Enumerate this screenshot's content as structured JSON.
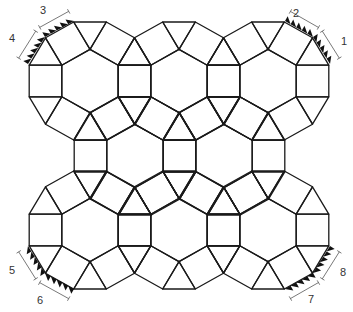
{
  "figure": {
    "edge_length": 32.6,
    "y_scale": 0.97,
    "colors": {
      "line": "#1a1a1a",
      "teeth": "#111111",
      "dimension": "#555555",
      "label": "#333333",
      "background": "#ffffff"
    },
    "hexagons": [
      {
        "cx": 90,
        "cy": 81
      },
      {
        "cx": 179,
        "cy": 81
      },
      {
        "cx": 268,
        "cy": 81
      },
      {
        "cx": 135,
        "cy": 156
      },
      {
        "cx": 224,
        "cy": 156
      },
      {
        "cx": 90,
        "cy": 230
      },
      {
        "cx": 179,
        "cy": 230
      },
      {
        "cx": 268,
        "cy": 230
      }
    ],
    "marked_edges": [
      {
        "label": "1",
        "x1": 330,
        "y1": 64,
        "x2": 313,
        "y2": 37,
        "label_x": 344,
        "label_y": 45
      },
      {
        "label": "2",
        "x1": 313,
        "y1": 37,
        "x2": 285,
        "y2": 21,
        "label_x": 296,
        "label_y": 17
      },
      {
        "label": "3",
        "x1": 74,
        "y1": 21,
        "x2": 45,
        "y2": 37,
        "label_x": 43,
        "label_y": 14
      },
      {
        "label": "4",
        "x1": 45,
        "y1": 37,
        "x2": 28,
        "y2": 64,
        "label_x": 12,
        "label_y": 42
      },
      {
        "label": "5",
        "x1": 28,
        "y1": 246,
        "x2": 45,
        "y2": 273,
        "label_x": 12,
        "label_y": 274
      },
      {
        "label": "6",
        "x1": 45,
        "y1": 273,
        "x2": 74,
        "y2": 289,
        "label_x": 40,
        "label_y": 304
      },
      {
        "label": "7",
        "x1": 285,
        "y1": 289,
        "x2": 313,
        "y2": 273,
        "label_x": 311,
        "label_y": 303
      },
      {
        "label": "8",
        "x1": 313,
        "y1": 273,
        "x2": 330,
        "y2": 246,
        "label_x": 343,
        "label_y": 276
      }
    ],
    "teeth_per_edge": 5,
    "dimension_offset": 11
  }
}
